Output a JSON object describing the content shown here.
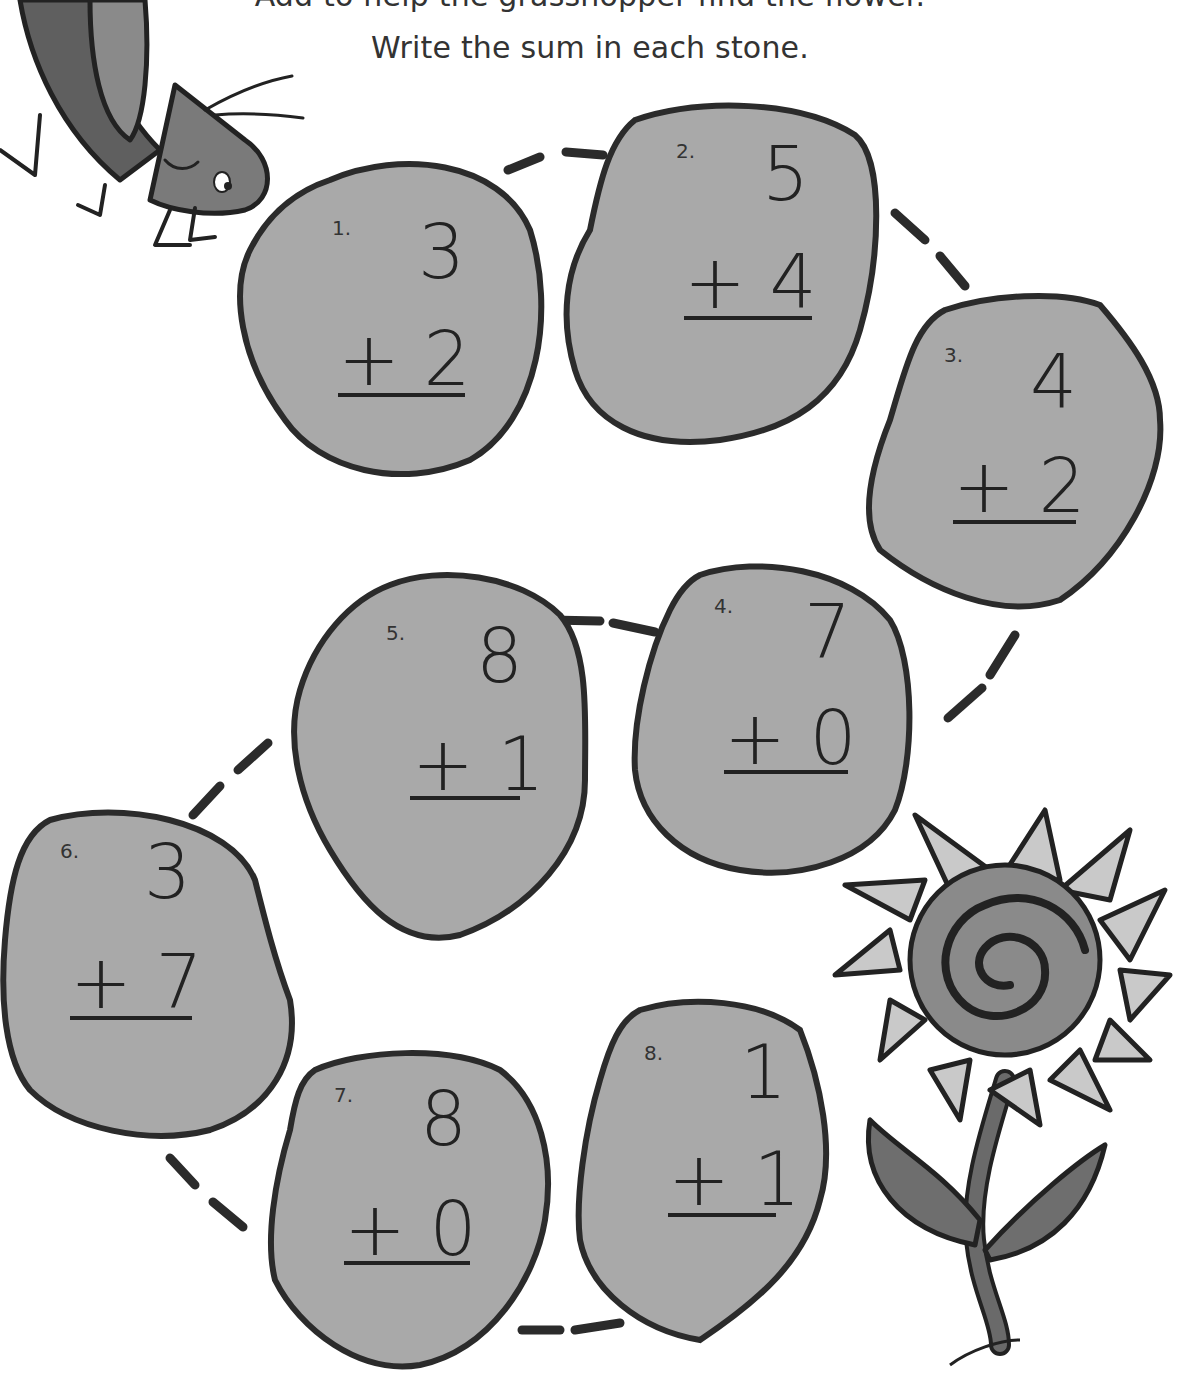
{
  "instructions": {
    "line1": "Add to help the grasshopper find the flower.",
    "line2": "Write the sum in each stone."
  },
  "colors": {
    "stone_fill": "#a9a9a9",
    "stone_outline": "#2b2b2b",
    "petal_fill": "#c9c9c9",
    "flower_center": "#8a8a8a",
    "leaf_fill": "#6e6e6e",
    "grasshopper_body": "#7a7a7a"
  },
  "problems": [
    {
      "label": "1.",
      "top": "3",
      "bottom": "+ 2"
    },
    {
      "label": "2.",
      "top": "5",
      "bottom": "+ 4"
    },
    {
      "label": "3.",
      "top": "4",
      "bottom": "+ 2"
    },
    {
      "label": "4.",
      "top": "7",
      "bottom": "+ 0"
    },
    {
      "label": "5.",
      "top": "8",
      "bottom": "+ 1"
    },
    {
      "label": "6.",
      "top": "3",
      "bottom": "+ 7"
    },
    {
      "label": "7.",
      "top": "8",
      "bottom": "+ 0"
    },
    {
      "label": "8.",
      "top": "1",
      "bottom": "+ 1"
    }
  ],
  "illustrations": {
    "start": "grasshopper-icon",
    "finish": "sunflower-icon"
  }
}
